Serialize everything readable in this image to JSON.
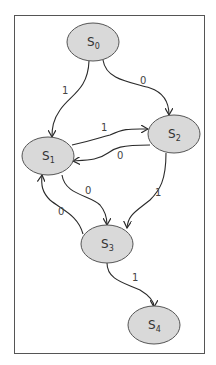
{
  "diagram": {
    "type": "state-transition",
    "colors": {
      "node_fill": "#d9d9d9",
      "node_stroke": "#555555",
      "edge": "#2a2a2a",
      "frame": "#555555"
    },
    "nodes": [
      {
        "id": "s0",
        "label": "S",
        "sub": "0"
      },
      {
        "id": "s1",
        "label": "S",
        "sub": "1"
      },
      {
        "id": "s2",
        "label": "S",
        "sub": "2"
      },
      {
        "id": "s3",
        "label": "S",
        "sub": "3"
      },
      {
        "id": "s4",
        "label": "S",
        "sub": "4"
      }
    ],
    "edges": [
      {
        "from": "s0",
        "to": "s1",
        "label": "1"
      },
      {
        "from": "s0",
        "to": "s2",
        "label": "0"
      },
      {
        "from": "s1",
        "to": "s2",
        "label": "1"
      },
      {
        "from": "s2",
        "to": "s1",
        "label": "0"
      },
      {
        "from": "s1",
        "to": "s3",
        "label": "0"
      },
      {
        "from": "s2",
        "to": "s3",
        "label": "1"
      },
      {
        "from": "s3",
        "to": "s1",
        "label": "0"
      },
      {
        "from": "s3",
        "to": "s4",
        "label": "1"
      }
    ]
  }
}
